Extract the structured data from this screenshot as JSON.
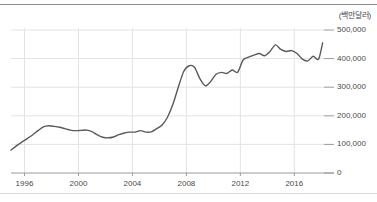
{
  "figure": {
    "unit_label": "(백만달러)"
  },
  "chart_data": {
    "type": "line",
    "title": "",
    "subtitle": "",
    "xlabel": "",
    "ylabel": "",
    "unit": "백만달러",
    "grid": true,
    "legend": false,
    "legend_position": "none",
    "line_color": "#5a5a5a",
    "grid_color": "#e3e3e3",
    "axis_color": "#9a9a9a",
    "text_color": "#4a4a4a",
    "xlim": [
      1995.0,
      2018.2
    ],
    "ylim": [
      0,
      500000
    ],
    "xticks": [
      1996,
      2000,
      2004,
      2008,
      2012,
      2016
    ],
    "xtick_labels": [
      "1996",
      "2000",
      "2004",
      "2008",
      "2012",
      "2016"
    ],
    "yticks": [
      0,
      100000,
      200000,
      300000,
      400000,
      500000
    ],
    "ytick_labels": [
      "0",
      "100,000",
      "200,000",
      "300,000",
      "400,000",
      "500,000"
    ],
    "series": [
      {
        "name": "value",
        "x": [
          1995.0,
          1995.4,
          1995.8,
          1996.2,
          1996.6,
          1997.0,
          1997.4,
          1997.8,
          1998.2,
          1998.6,
          1999.0,
          1999.4,
          1999.8,
          2000.2,
          2000.6,
          2001.0,
          2001.4,
          2001.8,
          2002.2,
          2002.6,
          2003.0,
          2003.4,
          2003.8,
          2004.2,
          2004.6,
          2005.0,
          2005.4,
          2005.8,
          2006.2,
          2006.6,
          2007.0,
          2007.4,
          2007.8,
          2008.2,
          2008.6,
          2009.0,
          2009.4,
          2009.8,
          2010.2,
          2010.6,
          2011.0,
          2011.4,
          2011.8,
          2012.2,
          2012.6,
          2013.0,
          2013.4,
          2013.8,
          2014.2,
          2014.6,
          2015.0,
          2015.4,
          2015.8,
          2016.2,
          2016.6,
          2017.0,
          2017.4,
          2017.8,
          2018.1
        ],
        "values": [
          80000,
          95000,
          108000,
          120000,
          133000,
          148000,
          161000,
          165000,
          163000,
          160000,
          155000,
          150000,
          148000,
          149000,
          150000,
          145000,
          133000,
          125000,
          123000,
          126000,
          134000,
          140000,
          143000,
          143000,
          148000,
          143000,
          144000,
          155000,
          168000,
          195000,
          240000,
          300000,
          355000,
          375000,
          370000,
          330000,
          305000,
          320000,
          345000,
          352000,
          348000,
          360000,
          352000,
          395000,
          405000,
          412000,
          418000,
          410000,
          425000,
          448000,
          432000,
          425000,
          428000,
          418000,
          398000,
          392000,
          408000,
          398000,
          455000
        ]
      }
    ],
    "annotations": [
      {
        "label": "peak 2008",
        "x": 2008.2,
        "y": 375000
      },
      {
        "label": "trough 2009",
        "x": 2009.4,
        "y": 305000
      },
      {
        "label": "peak 2014",
        "x": 2014.6,
        "y": 448000
      },
      {
        "label": "end 2018",
        "x": 2018.1,
        "y": 455000
      }
    ]
  }
}
